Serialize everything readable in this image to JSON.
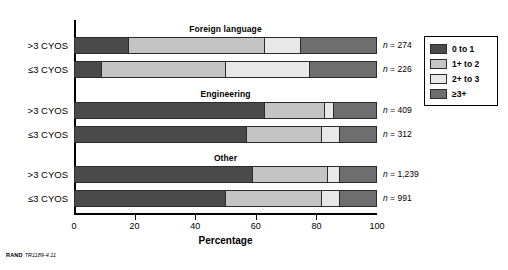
{
  "chart_data": {
    "type": "bar",
    "subtype": "stacked-horizontal-grouped",
    "title": "",
    "xlabel": "Percentage",
    "ylabel": "",
    "xlim": [
      0,
      100
    ],
    "xticks": [
      0,
      20,
      40,
      60,
      80,
      100
    ],
    "grid": false,
    "legend_position": "right",
    "series": [
      {
        "name": "0 to 1",
        "color": "#4a4a4a"
      },
      {
        "name": "1+ to 2",
        "color": "#c4c4c4"
      },
      {
        "name": "2+ to 3",
        "color": "#e8e8e8"
      },
      {
        "name": "≥3+",
        "color": "#6e6e6e"
      }
    ],
    "groups": [
      {
        "title": "Foreign language",
        "bars": [
          {
            "category": ">3 CYOS",
            "n_label": "n = 274",
            "n_value": 274,
            "values": [
              18,
              45,
              12,
              25
            ]
          },
          {
            "category": "≤3 CYOS",
            "n_label": "n = 226",
            "n_value": 226,
            "values": [
              9,
              41,
              28,
              22
            ]
          }
        ]
      },
      {
        "title": "Engineering",
        "bars": [
          {
            "category": ">3 CYOS",
            "n_label": "n = 409",
            "n_value": 409,
            "values": [
              63,
              20,
              3,
              14
            ]
          },
          {
            "category": "≤3 CYOS",
            "n_label": "n = 312",
            "n_value": 312,
            "values": [
              57,
              25,
              6,
              12
            ]
          }
        ]
      },
      {
        "title": "Other",
        "bars": [
          {
            "category": ">3 CYOS",
            "n_label": "n = 1,239",
            "n_value": 1239,
            "values": [
              59,
              25,
              4,
              12
            ]
          },
          {
            "category": "≤3 CYOS",
            "n_label": "n = 991",
            "n_value": 991,
            "values": [
              50,
              32,
              6,
              12
            ]
          }
        ]
      }
    ]
  },
  "legend": {
    "items": [
      {
        "label": "0 to 1",
        "color": "#4a4a4a"
      },
      {
        "label": "1+ to 2",
        "color": "#c4c4c4"
      },
      {
        "label": "2+ to 3",
        "color": "#e8e8e8"
      },
      {
        "label": "≥3+",
        "color": "#6e6e6e"
      }
    ]
  },
  "axis": {
    "x_title": "Percentage",
    "x_tick_labels": [
      "0",
      "20",
      "40",
      "60",
      "80",
      "100"
    ]
  },
  "source": {
    "org": "RAND",
    "doc_id": "TR1189-4.11"
  }
}
